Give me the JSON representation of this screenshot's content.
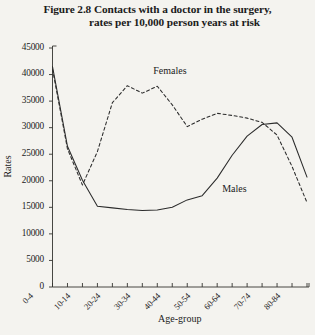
{
  "figure": {
    "title_line1": "Figure 2.8  Contacts with a doctor in the surgery,",
    "title_line2": "rates per 10,000 person years at risk",
    "xlabel": "Age-group",
    "ylabel": "Rates"
  },
  "chart_data": {
    "type": "line",
    "title": "Figure 2.8  Contacts with a doctor in the surgery, rates per 10,000 person years at risk",
    "xlabel": "Age-group",
    "ylabel": "Rates",
    "ylim": [
      0,
      45000
    ],
    "ytick_step": 5000,
    "yticks": [
      "0",
      "5000",
      "10000",
      "15000",
      "20000",
      "25000",
      "30000",
      "35000",
      "40000",
      "45000"
    ],
    "grid": false,
    "legend": "inline-labels",
    "categories": [
      "0-4",
      "5-9",
      "10-14",
      "15-19",
      "20-24",
      "25-29",
      "30-34",
      "35-39",
      "40-44",
      "45-49",
      "50-54",
      "55-59",
      "60-64",
      "65-69",
      "70-74",
      "75-79",
      "80-84",
      "85+"
    ],
    "xtick_labels_shown": [
      "0-4",
      "10-14",
      "20-24",
      "30-34",
      "40-44",
      "50-54",
      "60-64",
      "70-74",
      "80-84"
    ],
    "series": [
      {
        "name": "Males",
        "style": "solid",
        "color": "#2b2b2b",
        "values": [
          41500,
          26500,
          20100,
          15200,
          14900,
          14600,
          14400,
          14500,
          15000,
          16400,
          17200,
          20500,
          24800,
          28400,
          30600,
          30900,
          28200,
          20700
        ]
      },
      {
        "name": "Females",
        "style": "dashed",
        "color": "#2b2b2b",
        "values": [
          41000,
          26000,
          19200,
          25500,
          34700,
          37900,
          36500,
          37800,
          34300,
          30200,
          31600,
          32700,
          32300,
          31800,
          31000,
          28600,
          22700,
          15900
        ]
      }
    ],
    "annotations": [
      {
        "text": "Females",
        "at_category": "35-39"
      },
      {
        "text": "Males",
        "at_category": "55-59"
      }
    ]
  }
}
